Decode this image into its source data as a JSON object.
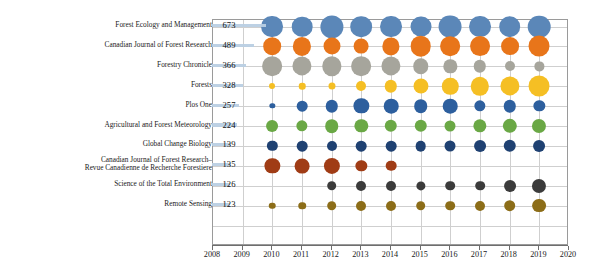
{
  "chart_data": {
    "type": "bubble",
    "title": "",
    "xlabel": "",
    "ylabel": "",
    "xlim": [
      2008,
      2020
    ],
    "grid": true,
    "legend": "none",
    "x_tick_labels": [
      "2008",
      "2009",
      "2010",
      "2011",
      "2012",
      "2013",
      "2014",
      "2015",
      "2016",
      "2017",
      "2018",
      "2019",
      "2020"
    ],
    "x": [
      2010,
      2011,
      2012,
      2013,
      2014,
      2015,
      2016,
      2017,
      2018,
      2019
    ],
    "categories": [
      "Forest Ecology and Management",
      "Canadian Journal of Forest Research",
      "Forestry Chronicle",
      "Forests",
      "Plos One",
      "Agricultural and Forest Meteorology",
      "Global Change Biology",
      "Canadian Journal of Forest Research–Revue Canadienne de Recherche Forestiere",
      "Science of the Total Environment",
      "Remote Sensing"
    ],
    "totals": [
      673,
      489,
      366,
      328,
      257,
      224,
      139,
      135,
      126,
      123
    ],
    "series": [
      {
        "name": "Forest Ecology and Management",
        "color": "#5b87b8",
        "values": [
          68,
          60,
          76,
          66,
          68,
          62,
          74,
          68,
          66,
          72
        ]
      },
      {
        "name": "Canadian Journal of Forest Research",
        "color": "#e8751a",
        "values": [
          44,
          47,
          41,
          31,
          42,
          60,
          55,
          56,
          45,
          62
        ]
      },
      {
        "name": "Forestry Chronicle",
        "color": "#a6a59c",
        "values": [
          55,
          52,
          53,
          55,
          52,
          34,
          25,
          22,
          14,
          12
        ]
      },
      {
        "name": "Forests",
        "color": "#f5bf24",
        "values": [
          5,
          6,
          7,
          14,
          22,
          32,
          38,
          48,
          52,
          62
        ]
      },
      {
        "name": "Plos One",
        "color": "#2d5f9e",
        "values": [
          4,
          16,
          22,
          33,
          30,
          26,
          30,
          18,
          22,
          18
        ]
      },
      {
        "name": "Agricultural and Forest Meteorology",
        "color": "#6aa845",
        "values": [
          20,
          18,
          26,
          25,
          22,
          22,
          17,
          25,
          29,
          28
        ]
      },
      {
        "name": "Global Change Biology",
        "color": "#1f4172",
        "values": [
          15,
          16,
          14,
          16,
          16,
          16,
          17,
          20,
          22,
          20
        ]
      },
      {
        "name": "Canadian Journal of Forest Research–Revue Canadienne de Recherche Forestiere",
        "color": "#a03c15",
        "values": [
          33,
          31,
          37,
          18,
          16,
          0,
          0,
          0,
          0,
          0
        ]
      },
      {
        "name": "Science of the Total Environment",
        "color": "#3b3b3b",
        "values": [
          0,
          0,
          13,
          14,
          14,
          12,
          13,
          13,
          20,
          28
        ]
      },
      {
        "name": "Remote Sensing",
        "color": "#8c6d18",
        "values": [
          6,
          8,
          13,
          14,
          14,
          13,
          13,
          14,
          19,
          27
        ]
      }
    ]
  },
  "axis": {
    "x_ticks": [
      "2008",
      "2009",
      "2010",
      "2011",
      "2012",
      "2013",
      "2014",
      "2015",
      "2016",
      "2017",
      "2018",
      "2019",
      "2020"
    ]
  },
  "rows": [
    {
      "label": "Forest Ecology and Management",
      "value": "673"
    },
    {
      "label": "Canadian Journal of Forest Research",
      "value": "489"
    },
    {
      "label": "Forestry Chronicle",
      "value": "366"
    },
    {
      "label": "Forests",
      "value": "328"
    },
    {
      "label": "Plos One",
      "value": "257"
    },
    {
      "label": "Agricultural and Forest Meteorology",
      "value": "224"
    },
    {
      "label": "Global Change Biology",
      "value": "139"
    },
    {
      "label": "Canadian Journal of Forest Research– Revue Canadienne de Recherche Forestiere",
      "value": "135"
    },
    {
      "label": "Science of the Total Environment",
      "value": "126"
    },
    {
      "label": "Remote Sensing",
      "value": "123"
    }
  ],
  "colors": {
    "bar_fill": "#b9cfe3",
    "grid": "#cfcfcf",
    "axis": "#6e6e6e"
  }
}
